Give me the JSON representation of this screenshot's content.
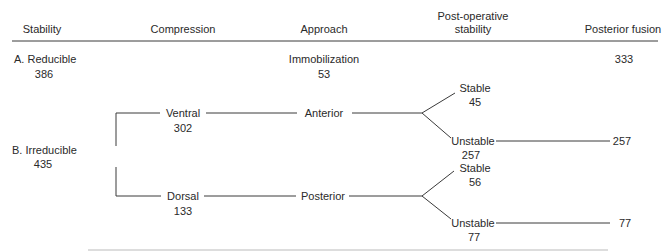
{
  "headers": {
    "stability": "Stability",
    "compression": "Compression",
    "approach": "Approach",
    "post_op_line1": "Post-operative",
    "post_op_line2": "stability",
    "posterior_fusion": "Posterior fusion"
  },
  "reducible": {
    "label": "A. Reducible",
    "count": "386",
    "approach_label": "Immobilization",
    "approach_count": "53",
    "fusion_count": "333"
  },
  "irreducible": {
    "label": "B. Irreducible",
    "count": "435",
    "ventral": {
      "label": "Ventral",
      "count": "302",
      "approach": "Anterior",
      "stable_label": "Stable",
      "stable_count": "45",
      "unstable_label": "Unstable",
      "unstable_count": "257",
      "fusion_count": "257"
    },
    "dorsal": {
      "label": "Dorsal",
      "count": "133",
      "approach": "Posterior",
      "stable_label": "Stable",
      "stable_count": "56",
      "unstable_label": "Unstable",
      "unstable_count": "77",
      "fusion_count": "77"
    }
  },
  "colors": {
    "text": "#2a2a2a",
    "lines": "#3a3a3a",
    "background": "#ffffff"
  }
}
